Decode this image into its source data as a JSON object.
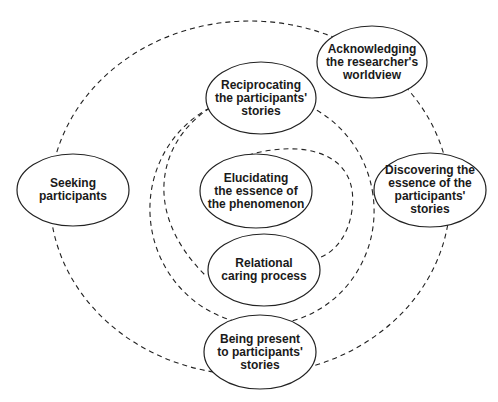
{
  "diagram": {
    "type": "concentric-process-diagram",
    "colors": {
      "stroke": "#222222",
      "text": "#1a1a1a",
      "background": "#ffffff"
    },
    "nodes": [
      {
        "id": "acknowledging",
        "label": "Acknowledging the researcher's worldview",
        "lines": [
          "Acknowledging",
          "the researcher's",
          "worldview"
        ],
        "cx": 372,
        "cy": 62,
        "rx": 55,
        "ry": 36
      },
      {
        "id": "reciprocating",
        "label": "Reciprocating the participants' stories",
        "lines": [
          "Reciprocating",
          "the participants'",
          "stories"
        ],
        "cx": 261,
        "cy": 98,
        "rx": 55,
        "ry": 36
      },
      {
        "id": "seeking",
        "label": "Seeking participants",
        "lines": [
          "Seeking",
          "participants"
        ],
        "cx": 73,
        "cy": 190,
        "rx": 56,
        "ry": 36
      },
      {
        "id": "elucidating",
        "label": "Elucidating the essence of the phenomenon",
        "lines": [
          "Elucidating",
          "the essence of",
          "the phenomenon"
        ],
        "cx": 256,
        "cy": 191,
        "rx": 56,
        "ry": 37
      },
      {
        "id": "discovering",
        "label": "Discovering the essence of the participants' stories",
        "lines": [
          "Discovering the",
          "essence of the",
          "participants'",
          "stories"
        ],
        "cx": 430,
        "cy": 190,
        "rx": 56,
        "ry": 37
      },
      {
        "id": "relational",
        "label": "Relational caring process",
        "lines": [
          "Relational",
          "caring process"
        ],
        "cx": 264,
        "cy": 270,
        "rx": 56,
        "ry": 36
      },
      {
        "id": "being-present",
        "label": "Being present to participants' stories",
        "lines": [
          "Being present",
          "to participants'",
          "stories"
        ],
        "cx": 260,
        "cy": 352,
        "rx": 56,
        "ry": 37
      }
    ],
    "connectors": [
      {
        "name": "outer-dashed-circle",
        "style": "dashed"
      },
      {
        "name": "middle-dashed-circle",
        "style": "dashed"
      },
      {
        "name": "inner-dashed-loop",
        "style": "dashed"
      }
    ]
  }
}
